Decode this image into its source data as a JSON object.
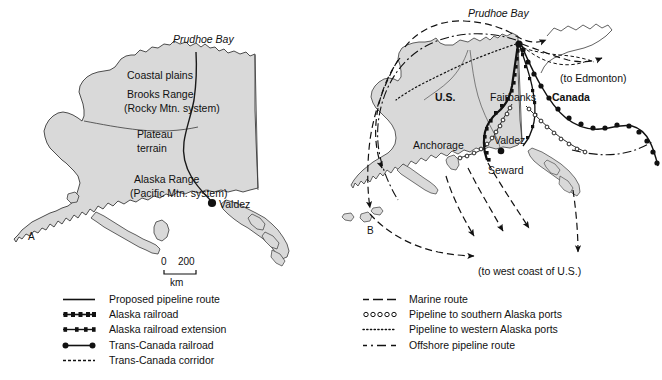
{
  "figure": {
    "panels": [
      {
        "letter": "A",
        "title_labels": [
          "Prudhoe Bay",
          "Coastal plains",
          "Brooks Range",
          "(Rocky Mtn. system)",
          "Plateau",
          "terrain",
          "Alaska  Range",
          "(Pacific Mtn. system)",
          "Valdez"
        ]
      },
      {
        "letter": "B",
        "title_labels": [
          "Prudhoe Bay",
          "U.S.",
          "Canada",
          "Fairbanks",
          "Valdez",
          "Anchorage",
          "Seward",
          "(to Edmonton)",
          "(to west coast of U.S.)"
        ]
      }
    ]
  },
  "panel_a": {
    "letter": "A",
    "labels": {
      "prudhoe_bay": "Prudhoe Bay",
      "coastal_plains": "Coastal plains",
      "brooks_range": "Brooks Range",
      "brooks_range_sub": "(Rocky Mtn. system)",
      "plateau": "Plateau",
      "terrain": "terrain",
      "alaska_range": "Alaska  Range",
      "alaska_range_sub": "(Pacific Mtn. system)",
      "valdez": "Valdez"
    },
    "scale_bar": {
      "start": "0",
      "end": "200",
      "units": "km"
    }
  },
  "panel_b": {
    "letter": "B",
    "labels": {
      "prudhoe_bay": "Prudhoe Bay",
      "country_us": "U.S.",
      "country_canada": "Canada",
      "fairbanks": "Fairbanks",
      "valdez": "Valdez",
      "anchorage": "Anchorage",
      "seward": "Seward",
      "to_edmonton": "(to Edmonton)",
      "to_west_coast": "(to west coast of U.S.)"
    }
  },
  "legend": {
    "left_column": [
      {
        "symbol": "solid-line",
        "label": "Proposed pipeline route"
      },
      {
        "symbol": "dense-dot-line",
        "label": "Alaska railroad"
      },
      {
        "symbol": "sparse-dot-line",
        "label": "Alaska railroad extension"
      },
      {
        "symbol": "two-dot-line",
        "label": "Trans-Canada railroad"
      },
      {
        "symbol": "fine-dashed-line",
        "label": "Trans-Canada corridor"
      }
    ],
    "right_column": [
      {
        "symbol": "dash-dot-dash-line",
        "label": "Marine route"
      },
      {
        "symbol": "open-circle-line",
        "label": "Pipeline to southern Alaska ports"
      },
      {
        "symbol": "dotted-line",
        "label": "Pipeline to western Alaska ports"
      },
      {
        "symbol": "dash-dot-line",
        "label": "Offshore pipeline route"
      }
    ]
  },
  "colors": {
    "land_fill": "#d9d9d9",
    "coastline": "#3a3a3a",
    "ink": "#111111",
    "background": "#ffffff"
  }
}
